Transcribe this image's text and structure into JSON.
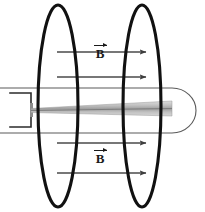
{
  "figure": {
    "background_color": "#ffffff",
    "width": 205,
    "height": 212,
    "labels": {
      "b_field_top": "B",
      "b_field_bottom": "B",
      "vector_arrow_glyph": "→"
    },
    "colors": {
      "coil_stroke": "#111111",
      "field_arrow": "#4a4a4a",
      "envelope_stroke": "#555555",
      "gun_stroke": "#2b2b2b",
      "beam_fill_light": "#d9d9d9",
      "beam_fill_mid": "#b8b8b8",
      "beam_fill_dark": "#9c9c9c"
    },
    "elements": {
      "coil_left": {
        "name": "left-coil-ellipse",
        "cx": 58,
        "cy": 106,
        "rx": 20,
        "ry": 101
      },
      "coil_right": {
        "name": "right-coil-ellipse",
        "cx": 142,
        "cy": 106,
        "rx": 19,
        "ry": 101
      },
      "envelope": {
        "name": "vacuum-tube-envelope",
        "x_left": 0,
        "x_right": 197,
        "y_top": 88,
        "y_bottom": 133
      },
      "beam": {
        "name": "electron-beam-wedge",
        "x_start": 28,
        "x_end": 172,
        "half_width_start": 1,
        "half_width_end": 7
      },
      "electron_gun": {
        "name": "electron-gun-bracket",
        "x": 8,
        "y_top": 92,
        "y_bottom": 128,
        "width": 22
      }
    },
    "field_arrows": [
      {
        "name": "field-arrow-top-1",
        "y": 52,
        "x_start": 57,
        "x_end": 149
      },
      {
        "name": "field-arrow-top-2",
        "y": 77,
        "x_start": 57,
        "x_end": 149
      },
      {
        "name": "field-arrow-bottom-1",
        "y": 143,
        "x_start": 57,
        "x_end": 149
      },
      {
        "name": "field-arrow-bottom-2",
        "y": 173,
        "x_start": 57,
        "x_end": 149
      }
    ]
  }
}
